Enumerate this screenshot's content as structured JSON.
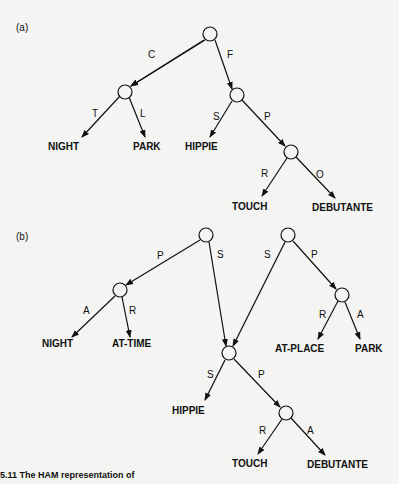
{
  "panels": {
    "a": {
      "label": "(a)",
      "edges": {
        "root_c": "C",
        "root_f": "F",
        "c_t": "T",
        "c_l": "L",
        "f_s": "S",
        "f_p": "P",
        "p_r": "R",
        "p_o": "O"
      },
      "terminals": {
        "night": "NIGHT",
        "park": "PARK",
        "hippie": "HIPPIE",
        "touch": "TOUCH",
        "debutante": "DEBUTANTE"
      }
    },
    "b": {
      "label": "(b)",
      "edges": {
        "r1_p": "P",
        "r1_s": "S",
        "r2_s": "S",
        "r2_p": "P",
        "left_a": "A",
        "left_r": "R",
        "right_r": "R",
        "right_a": "A",
        "shared_s": "S",
        "shared_p": "P",
        "sub_r": "R",
        "sub_a": "A"
      },
      "terminals": {
        "night": "NIGHT",
        "at_time": "AT-TIME",
        "at_place": "AT-PLACE",
        "park": "PARK",
        "hippie": "HIPPIE",
        "touch": "TOUCH",
        "debutante": "DEBUTANTE"
      }
    }
  },
  "caption": "5.11  The HAM representation of"
}
